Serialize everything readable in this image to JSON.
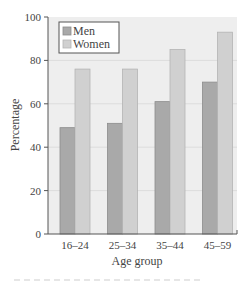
{
  "chart_data": {
    "type": "bar",
    "title": "",
    "xlabel": "Age group",
    "ylabel": "Percentage",
    "categories": [
      "16–24",
      "25–34",
      "35–44",
      "45–59"
    ],
    "series": [
      {
        "name": "Men",
        "values": [
          49,
          51,
          61,
          70
        ],
        "color": "#a9a9a9"
      },
      {
        "name": "Women",
        "values": [
          76,
          76,
          85,
          93
        ],
        "color": "#d0d0d0"
      }
    ],
    "ylim": [
      0,
      100
    ],
    "yticks": [
      0,
      20,
      40,
      60,
      80,
      100
    ],
    "grid": true,
    "legend_position": "top-left"
  },
  "colors": {
    "plot_background": "#eeeeee",
    "gridline": "#dcdcdc",
    "axis": "#555555",
    "men_border": "#8c8c8c",
    "women_border": "#b4b4b4"
  }
}
